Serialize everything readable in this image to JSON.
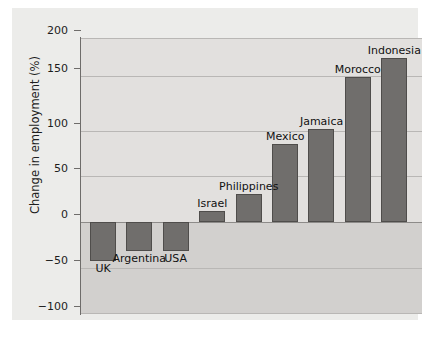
{
  "chart_data": {
    "type": "bar",
    "title": "",
    "xlabel": "",
    "ylabel": "Change in employment (%)",
    "categories": [
      "UK",
      "Argentina",
      "USA",
      "Israel",
      "Philippines",
      "Mexico",
      "Jamaica",
      "Morocco",
      "Indonesia"
    ],
    "values": [
      -42,
      -32,
      -31,
      12,
      30,
      85,
      101,
      158,
      178
    ],
    "ylim": [
      -100,
      200
    ],
    "yticks": [
      200,
      150,
      100,
      50,
      0,
      -50,
      -100
    ],
    "ytick_labels": [
      "200",
      "150",
      "100",
      "50",
      "0",
      "−50",
      "−100"
    ],
    "grid": true,
    "legend": "none",
    "bar_color": "#706e6c",
    "bar_edge_color": "#4f4d4b",
    "plot_background": "#e2e0de",
    "negative_band_color": "#d2d0ce",
    "panel_background": "#ececea",
    "label_placement": "above-bar for positive values, below-bar for negative values"
  }
}
